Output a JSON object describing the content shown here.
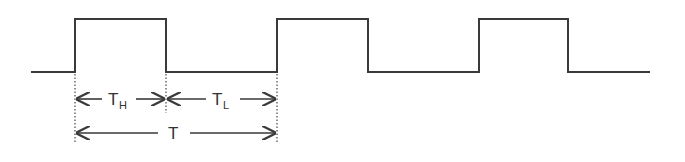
{
  "diagram": {
    "type": "square-wave-timing",
    "stroke_color": "#3a3a3a",
    "waveform": {
      "low_y": 72,
      "high_y": 19,
      "points_x": [
        31,
        75,
        166,
        277,
        368,
        479,
        568,
        650
      ],
      "description": "periodic rectangular pulse train, 3 high pulses"
    },
    "labels": {
      "high_time": {
        "main": "T",
        "sub": "H"
      },
      "low_time": {
        "main": "T",
        "sub": "L"
      },
      "period": {
        "main": "T"
      }
    },
    "dimension_lines": [
      {
        "name": "high-time",
        "from_x": 75,
        "to_x": 166,
        "y": 99
      },
      {
        "name": "low-time",
        "from_x": 166,
        "to_x": 277,
        "y": 99
      },
      {
        "name": "period",
        "from_x": 75,
        "to_x": 277,
        "y": 140
      }
    ]
  }
}
